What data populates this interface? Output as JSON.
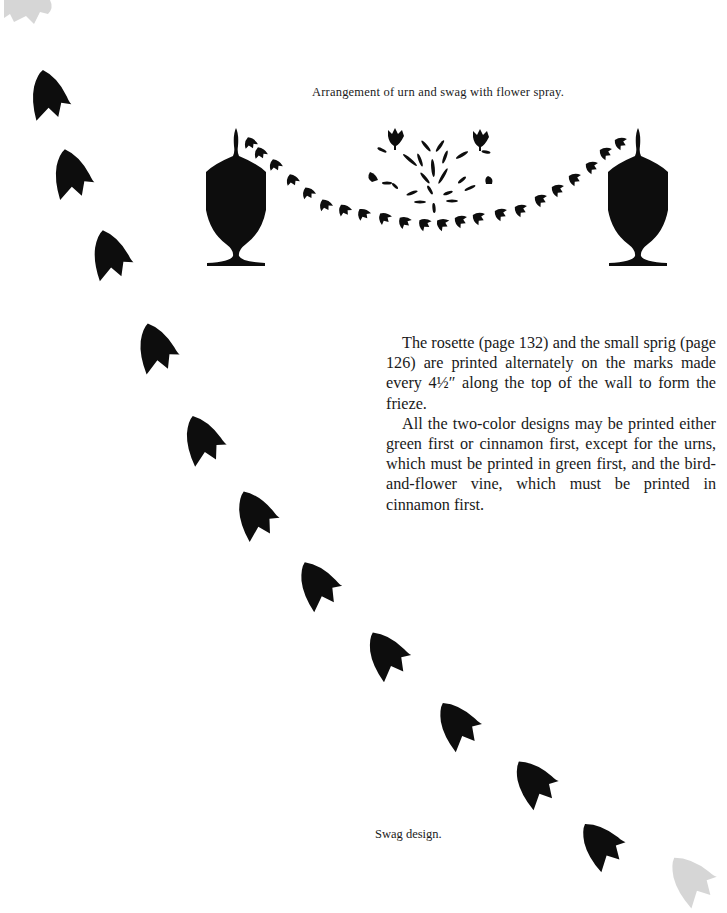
{
  "page": {
    "captions": {
      "top": "Arrangement of urn and swag with flower spray.",
      "bottom": "Swag design."
    },
    "body": {
      "paragraphs": [
        "The rosette (page 132) and the small sprig (page 126) are printed alternately on the marks made every 4½″ along the top of the wall to form the frieze.",
        "All the two-color designs may be printed either green first or cinnamon first, except for the urns, which must be printed in green first, and the bird-and-flower vine, which must be printed in cinnamon first."
      ]
    },
    "illustrations": {
      "top_arrangement": {
        "elements": [
          "urn-left",
          "swag-small-leaves",
          "flower-spray",
          "urn-right"
        ]
      },
      "swag_design": {
        "leaf_count": 11,
        "ghost_leaves": 2
      }
    },
    "colors": {
      "ink": "#0d0d0d",
      "ghost": "#d6d6d6",
      "paper": "#ffffff"
    }
  }
}
